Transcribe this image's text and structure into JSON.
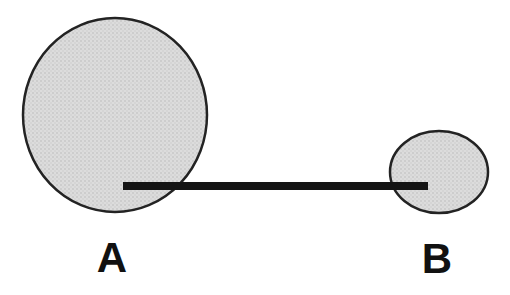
{
  "diagram": {
    "nodes": [
      {
        "id": "A",
        "label": "A",
        "size": "large"
      },
      {
        "id": "B",
        "label": "B",
        "size": "small"
      }
    ],
    "connector": {
      "type": "thick-horizontal-line"
    },
    "colors": {
      "background": "#ffffff",
      "circle_fill_base": "#dcdcdc",
      "circle_fill_dot1": "#b4b4b4",
      "circle_fill_dot2": "#c9c9c9",
      "circle_stroke": "#232323",
      "line_color": "#141414",
      "label_color": "#111111"
    }
  }
}
